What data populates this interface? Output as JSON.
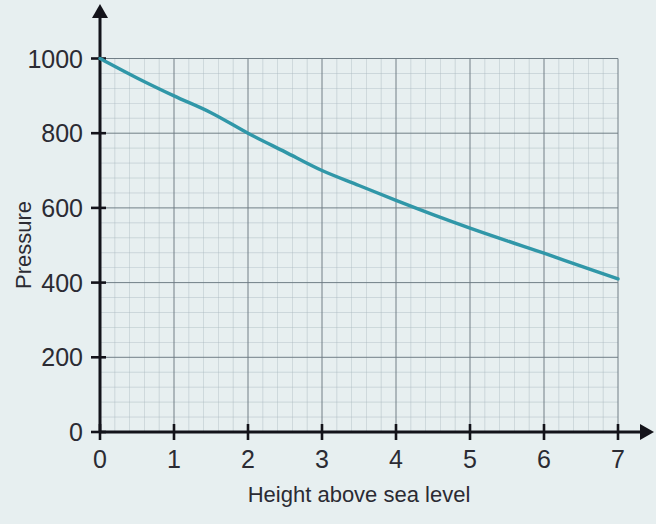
{
  "page": {
    "background_color": "#e7eff0",
    "kind": "printed-graph-figure"
  },
  "chart_data": {
    "type": "line",
    "title": "",
    "subtitle": "",
    "xlabel": "Height above sea level",
    "ylabel": "Pressure",
    "xlim": [
      0,
      7
    ],
    "ylim": [
      0,
      1000
    ],
    "x_ticks": [
      0,
      1,
      2,
      3,
      4,
      5,
      6,
      7
    ],
    "x_tick_labels": [
      "0",
      "1",
      "2",
      "3",
      "4",
      "5",
      "6",
      "7"
    ],
    "y_ticks": [
      0,
      200,
      400,
      600,
      800,
      1000
    ],
    "y_tick_labels": [
      "0",
      "200",
      "400",
      "600",
      "800",
      "1000"
    ],
    "grid": true,
    "grid_minor_per_major": 5,
    "legend": false,
    "legend_position": "none",
    "series": [
      {
        "name": "Pressure vs height",
        "color": "#3097a8",
        "x": [
          0,
          0.5,
          1,
          1.5,
          2,
          2.5,
          3,
          3.5,
          4,
          4.5,
          5,
          5.5,
          6,
          6.5,
          7
        ],
        "y": [
          1000,
          948,
          900,
          855,
          800,
          750,
          700,
          660,
          620,
          582,
          546,
          512,
          479,
          444,
          410
        ]
      }
    ],
    "annotations": []
  },
  "axis_labels": {
    "x_axis_title": "Height above sea level",
    "y_axis_title": "Pressure"
  },
  "colors": {
    "background": "#e7eff0",
    "curve": "#3097a8",
    "axis": "#13131a",
    "grid_minor": "#aab8bf",
    "grid_major": "#6c7a82",
    "text": "#2b2b33"
  }
}
